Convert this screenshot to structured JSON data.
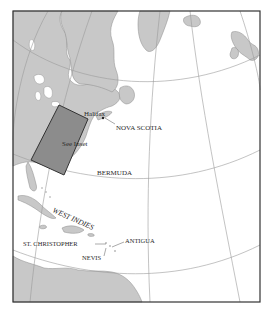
{
  "map": {
    "colors": {
      "land": "#c8c8c8",
      "land_stroke": "#8a8a8a",
      "water": "#ffffff",
      "graticule": "#9a9a9a",
      "inset_fill": "#8c8c8c",
      "frame": "#333333",
      "text": "#2a2a2a"
    },
    "labels": {
      "halifax": "Halifax",
      "nova_scotia": "NOVA SCOTIA",
      "see_inset": "See Inset",
      "bermuda": "BERMUDA",
      "west_indies": "WEST INDIES",
      "st_christopher": "ST. CHRISTOPHER",
      "antigua": "ANTIGUA",
      "nevis": "NEVIS"
    }
  }
}
